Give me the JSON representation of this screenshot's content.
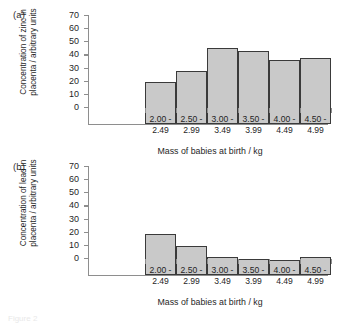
{
  "figure": {
    "caption": "Figure 2",
    "panel_a_label": "(a)",
    "panel_b_label": "(b)",
    "bar_fill_color": "#c9c9c9",
    "bar_edge_color": "#3a3a3a",
    "axis_color": "#8e8e8e"
  },
  "chart_data": [
    {
      "type": "bar",
      "panel": "(a)",
      "title": "",
      "xlabel": "Mass of babies at birth / kg",
      "ylabel": "Concentration of zinc in placenta / arbitrary units",
      "categories": [
        "2.00 - 2.49",
        "2.50 - 2.99",
        "3.00 - 3.49",
        "3.50 - 3.99",
        "4.00 - 4.49",
        "4.50 - 4.99"
      ],
      "category_lines": [
        [
          "2.00 -",
          "2.49"
        ],
        [
          "2.50 -",
          "2.99"
        ],
        [
          "3.00 -",
          "3.49"
        ],
        [
          "3.50 -",
          "3.99"
        ],
        [
          "4.00 -",
          "4.49"
        ],
        [
          "4.50 -",
          "4.99"
        ]
      ],
      "values": [
        32,
        40.5,
        58,
        55.5,
        49,
        50.5
      ],
      "ylim": [
        0,
        70
      ],
      "yticks": [
        0,
        10,
        20,
        30,
        40,
        50,
        60,
        70
      ],
      "grid": false,
      "legend": false
    },
    {
      "type": "bar",
      "panel": "(b)",
      "title": "",
      "xlabel": "Mass of babies at birth / kg",
      "ylabel": "Concentration of lead in placenta / arbitrary units",
      "categories": [
        "2.00 - 2.49",
        "2.50 - 2.99",
        "3.00 - 3.49",
        "3.50 - 3.99",
        "4.00 - 4.49",
        "4.50 - 4.99"
      ],
      "category_lines": [
        [
          "2.00 -",
          "2.49"
        ],
        [
          "2.50 -",
          "2.99"
        ],
        [
          "3.00 -",
          "3.49"
        ],
        [
          "3.50 -",
          "3.99"
        ],
        [
          "4.00 -",
          "4.49"
        ],
        [
          "4.50 -",
          "4.99"
        ]
      ],
      "values": [
        31.5,
        22,
        13.5,
        12,
        11.5,
        13.5
      ],
      "ylim": [
        0,
        70
      ],
      "yticks": [
        0,
        10,
        20,
        30,
        40,
        50,
        60,
        70
      ],
      "grid": false,
      "legend": false
    }
  ]
}
